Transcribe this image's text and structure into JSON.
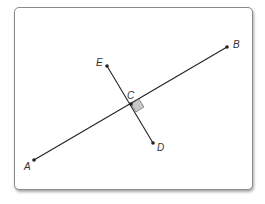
{
  "diagram": {
    "type": "perpendicular-lines",
    "points": {
      "A": {
        "label": "A",
        "x": 34,
        "y": 160
      },
      "B": {
        "label": "B",
        "x": 227,
        "y": 47
      },
      "C": {
        "label": "C",
        "x": 131,
        "y": 104
      },
      "D": {
        "label": "D",
        "x": 153,
        "y": 143
      },
      "E": {
        "label": "E",
        "x": 107,
        "y": 66
      }
    },
    "segments": [
      [
        "A",
        "B"
      ],
      [
        "E",
        "D"
      ]
    ],
    "right_angle_marker_at": "C",
    "colors": {
      "line": "#222222",
      "marker_fill": "#c8c8c8",
      "frame_border": "#8a8a8a"
    }
  }
}
